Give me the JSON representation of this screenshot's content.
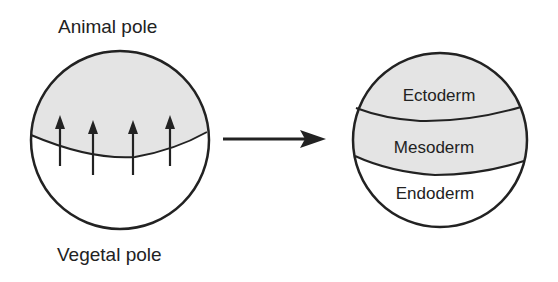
{
  "diagram": {
    "left_sphere": {
      "top_label": "Animal pole",
      "bottom_label": "Vegetal pole",
      "upper_region": "animal hemisphere (shaded)",
      "lower_region": "vegetal hemisphere (unshaded)",
      "arrows": {
        "count": 4,
        "direction": "up"
      }
    },
    "transition_arrow": {
      "direction": "right"
    },
    "right_sphere": {
      "layers": [
        {
          "name": "Ectoderm",
          "shade": "#e4e4e4"
        },
        {
          "name": "Mesoderm",
          "shade": "#e4e4e4"
        },
        {
          "name": "Endoderm",
          "shade": "#ffffff"
        }
      ]
    },
    "colors": {
      "ink": "#222222",
      "shade": "#e4e4e4",
      "stipple": "#9a9a9a"
    }
  }
}
